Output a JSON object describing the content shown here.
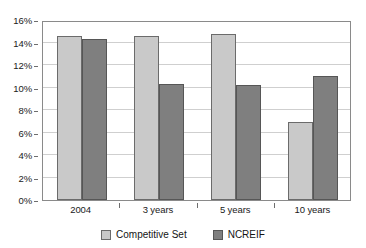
{
  "chart_data": {
    "type": "bar",
    "title": "",
    "subtitle": "",
    "xlabel": "",
    "ylabel": "",
    "categories": [
      "2004",
      "3 years",
      "5 years",
      "10 years"
    ],
    "series": [
      {
        "name": "Competitive Set",
        "color": "#c9c9c9",
        "values": [
          14.6,
          14.6,
          14.8,
          6.9
        ]
      },
      {
        "name": "NCREIF",
        "color": "#7f7f7f",
        "values": [
          14.3,
          10.3,
          10.2,
          11.0
        ]
      }
    ],
    "ylim": [
      0,
      16
    ],
    "ytick_step": 2,
    "ytick_labels": [
      "0%",
      "2%",
      "4%",
      "6%",
      "8%",
      "10%",
      "12%",
      "14%",
      "16%"
    ],
    "ytick_values": [
      0,
      2,
      4,
      6,
      8,
      10,
      12,
      14,
      16
    ],
    "value_suffix": "%",
    "grid": true,
    "grid_axis": "y",
    "legend_position": "bottom",
    "bar_border_color": "#6b6b6b",
    "frame_color": "#8a8a8a",
    "gridline_color": "#cfcfcf",
    "background_color": "#ffffff"
  }
}
